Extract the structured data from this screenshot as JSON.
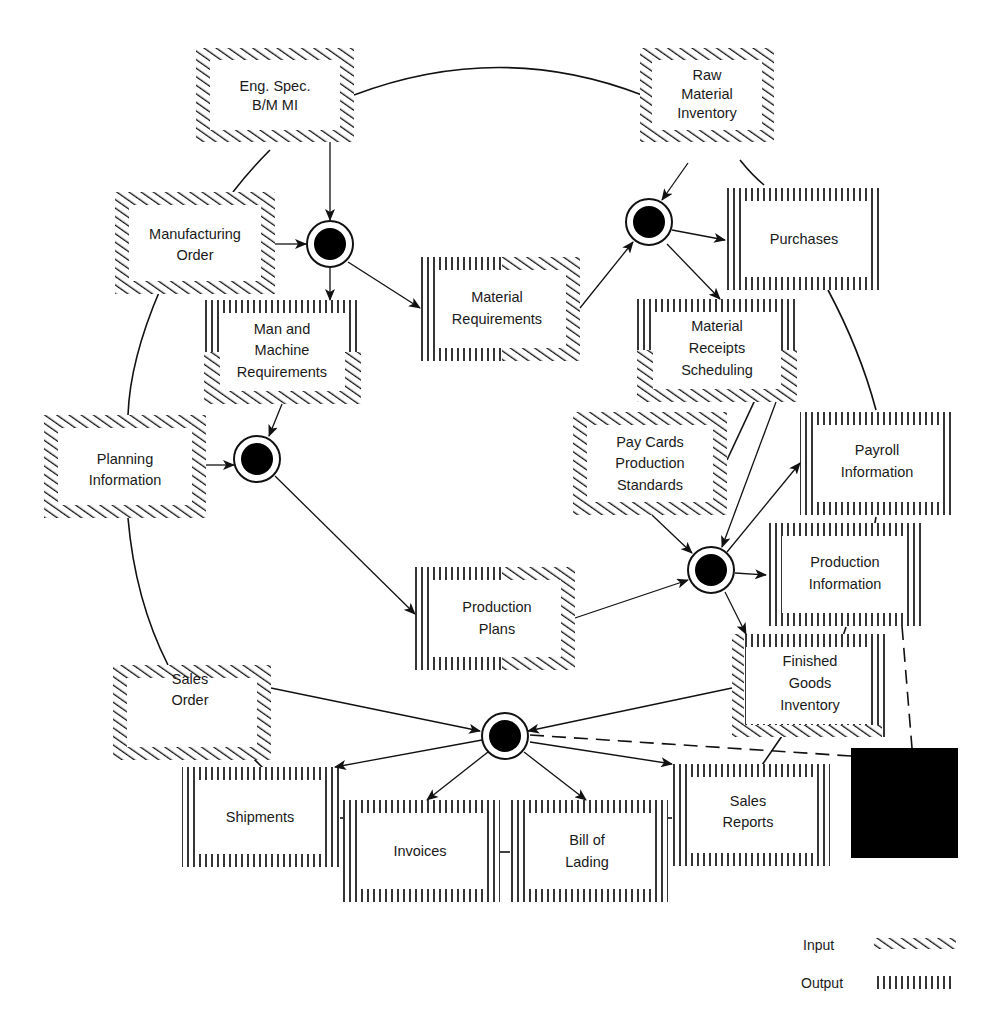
{
  "diagram": {
    "type": "data-flow / file-interaction cycle",
    "boxes": {
      "eng_spec": {
        "lines": [
          "Eng. Spec.",
          "B/M MI"
        ],
        "kind": "input"
      },
      "raw_material": {
        "lines": [
          "Raw",
          "Material",
          "Inventory"
        ],
        "kind": "input"
      },
      "manufacturing_order": {
        "lines": [
          "Manufacturing",
          "Order"
        ],
        "kind": "input"
      },
      "purchases": {
        "lines": [
          "Purchases"
        ],
        "kind": "output"
      },
      "man_machine": {
        "lines": [
          "Man and",
          "Machine",
          "Requirements"
        ],
        "kind": "output-input"
      },
      "material_requirements": {
        "lines": [
          "Material",
          "Requirements"
        ],
        "kind": "output-input"
      },
      "material_receipts": {
        "lines": [
          "Material",
          "Receipts",
          "Scheduling"
        ],
        "kind": "output-input"
      },
      "planning_information": {
        "lines": [
          "Planning",
          "Information"
        ],
        "kind": "input"
      },
      "pay_cards": {
        "lines": [
          "Pay Cards",
          "Production",
          "Standards"
        ],
        "kind": "input"
      },
      "payroll_information": {
        "lines": [
          "Payroll",
          "Information"
        ],
        "kind": "output"
      },
      "production_plans": {
        "lines": [
          "Production",
          "Plans"
        ],
        "kind": "output-input"
      },
      "production_information": {
        "lines": [
          "Production",
          "Information"
        ],
        "kind": "output"
      },
      "sales_order": {
        "lines": [
          "Sales",
          "Order"
        ],
        "kind": "input"
      },
      "finished_goods": {
        "lines": [
          "Finished",
          "Goods",
          "Inventory"
        ],
        "kind": "output-input"
      },
      "shipments": {
        "lines": [
          "Shipments"
        ],
        "kind": "output"
      },
      "invoices": {
        "lines": [
          "Invoices"
        ],
        "kind": "output"
      },
      "bill_of_lading": {
        "lines": [
          "Bill of",
          "Lading"
        ],
        "kind": "output"
      },
      "sales_reports": {
        "lines": [
          "Sales",
          "Reports"
        ],
        "kind": "output"
      }
    },
    "process_nodes": [
      "node-1",
      "node-2",
      "node-3",
      "node-4",
      "node-5"
    ],
    "colors": {
      "ink": "#111111",
      "background": "#ffffff"
    }
  },
  "legend": {
    "input_label": "Input",
    "output_label": "Output"
  }
}
